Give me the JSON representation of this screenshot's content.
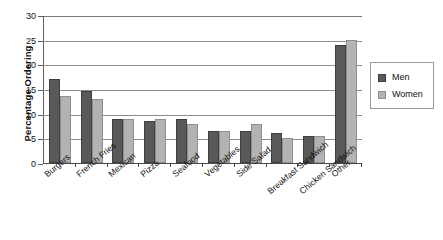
{
  "chart_data": {
    "type": "bar",
    "title": "",
    "xlabel": "",
    "ylabel": "Percentage Ordering",
    "ylim": [
      0,
      30
    ],
    "ytick_step": 5,
    "yticks": [
      "0",
      "5",
      "10",
      "15",
      "20",
      "25",
      "30"
    ],
    "grid": true,
    "legend_position": "right",
    "categories": [
      "Burgers",
      "French Fries",
      "Mexican",
      "Pizza",
      "Seafood",
      "Vegetables",
      "Side Salad",
      "Breakfast Sandwich",
      "Chicken Sandwich",
      "Other"
    ],
    "series": [
      {
        "name": "Men",
        "color": "#595959",
        "values": [
          17,
          14.5,
          9,
          8.5,
          9,
          6.5,
          6.5,
          6,
          5.5,
          24
        ]
      },
      {
        "name": "Women",
        "color": "#b3b3b3",
        "values": [
          13.5,
          13,
          9,
          9,
          8,
          6.5,
          8,
          5,
          5.5,
          25
        ]
      }
    ]
  },
  "legend": {
    "items": [
      {
        "label": "Men"
      },
      {
        "label": "Women"
      }
    ]
  },
  "colors": {
    "men": "#595959",
    "women": "#b3b3b3",
    "grid": "#8d8d8d",
    "axis": "#4a4a4a"
  }
}
